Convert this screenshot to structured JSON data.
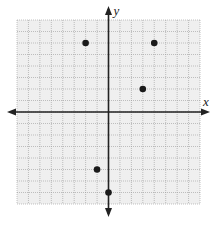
{
  "chart_data": {
    "type": "scatter",
    "title": "",
    "xlabel": "x",
    "ylabel": "y",
    "xlim": [
      -8,
      8
    ],
    "ylim": [
      -8,
      8
    ],
    "grid": true,
    "grid_step": 1,
    "tick_labels": false,
    "points": [
      {
        "x": -2,
        "y": 6
      },
      {
        "x": 4,
        "y": 6
      },
      {
        "x": 3,
        "y": 2
      },
      {
        "x": -1,
        "y": -5
      },
      {
        "x": 0,
        "y": -7
      }
    ],
    "colors": {
      "grid_background": "#efefef",
      "grid_line": "#9a9a9a",
      "axis": "#222222",
      "point": "#1a1a1a"
    }
  }
}
